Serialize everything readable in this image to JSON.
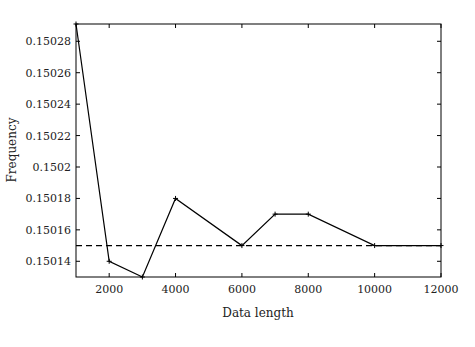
{
  "chart_data": {
    "type": "line",
    "title": "",
    "xlabel": "Data length",
    "ylabel": "Frequency",
    "xlim": [
      1000,
      12000
    ],
    "ylim": [
      0.15013,
      0.150291
    ],
    "grid": false,
    "legend": null,
    "x_ticks": [
      2000,
      4000,
      6000,
      8000,
      10000,
      12000
    ],
    "x_tick_labels": [
      "2000",
      "4000",
      "6000",
      "8000",
      "10000",
      "12000"
    ],
    "y_ticks": [
      0.15014,
      0.15016,
      0.15018,
      0.1502,
      0.15022,
      0.15024,
      0.15026,
      0.15028
    ],
    "y_tick_labels": [
      "0.15014",
      "0.15016",
      "0.15018",
      "0.1502",
      "0.15022",
      "0.15024",
      "0.15026",
      "0.15028"
    ],
    "series": [
      {
        "name": "estimated frequency",
        "style": "solid",
        "marker": "+",
        "color": "#000000",
        "x": [
          1000,
          2000,
          3000,
          4000,
          6000,
          7000,
          8000,
          10000,
          12000
        ],
        "y": [
          0.150291,
          0.15014,
          0.15013,
          0.15018,
          0.15015,
          0.15017,
          0.15017,
          0.15015,
          0.15015
        ]
      },
      {
        "name": "reference frequency",
        "style": "dashed",
        "color": "#000000",
        "x": [
          1000,
          12000
        ],
        "y": [
          0.15015,
          0.15015
        ]
      }
    ]
  }
}
